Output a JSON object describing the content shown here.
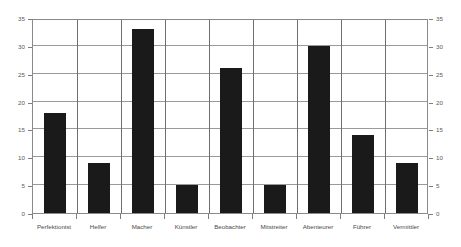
{
  "chart_data": {
    "type": "bar",
    "title": "",
    "subtitle": "",
    "xlabel": "",
    "ylabel": "",
    "categories": [
      "Perfektionist",
      "Helfer",
      "Macher",
      "Künstler",
      "Beobachter",
      "Mitstreiter",
      "Abenteurer",
      "Führer",
      "Vermittler"
    ],
    "values": [
      18,
      9,
      33,
      5,
      26,
      5,
      30,
      14,
      9
    ],
    "ylim": [
      0,
      35
    ],
    "ytick_values": [
      0,
      5,
      10,
      15,
      20,
      25,
      30,
      35
    ],
    "ytick_labels_left": [
      "0",
      "5",
      "10",
      "15",
      "20",
      "25",
      "30",
      "35"
    ],
    "ytick_labels_right": [
      "0",
      "5",
      "10",
      "15",
      "20",
      "25",
      "30",
      "35"
    ],
    "grid": true,
    "grid_axis": "both",
    "legend": false,
    "legend_position": "none",
    "bar_color": "#1a1a1a",
    "gridline_color": "#9a9a9a",
    "separator_color": "#6f6f6f",
    "axis_color": "#8a8a8a",
    "background_color": "#ffffff",
    "tick_label_color": "#5a5a5a",
    "category_label_color": "#4a4a4a"
  }
}
